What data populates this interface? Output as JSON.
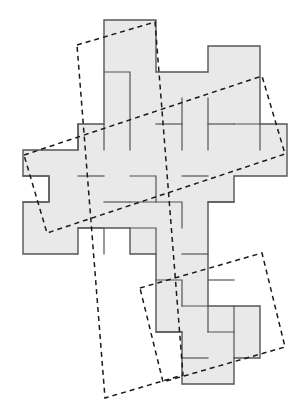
{
  "figure": {
    "kind": "geometric-diagram",
    "caption": "",
    "canvas": {
      "width": 308,
      "height": 403
    },
    "grid": {
      "cell_size": 26.0,
      "origin_x": 23.0,
      "origin_y": 20.0,
      "visible": false
    },
    "colors": {
      "background": "#ffffff",
      "tile_fill": "#e9e9e9",
      "tile_stroke": "#555555",
      "dashed_stroke": "#1a1a1a",
      "caption_text": "#bdbdbd"
    },
    "strokes": {
      "tile_outline_width": 1.2,
      "piece_divider_width": 1.2,
      "dashed_width": 1.5,
      "dash_pattern": "5,4"
    }
  },
  "shapes": {
    "outline_label": "composite-polyomino-outline",
    "outline_points": "104,20 156,20 156,72 208,72 208,46 260,46 260,124 287,124 287,176 234,176 234,202 208,202 208,306 260,306 260,358 234,358 234,384 182,384 182,332 156,332 156,254 130,254 130,228 78,228 78,254 23,254 23,202 49,202 49,176 23,176 23,150 78,150 78,124 104,124 104,20",
    "pieces": [
      {
        "name": "piece-top",
        "points": "104,20 156,20 156,124 182,124 182,98 208,98 208,150 130,150 130,72 104,72 104,20"
      },
      {
        "name": "piece-upper-right",
        "points": "208,72 260,72 260,46 260,124 287,124 287,176 234,176 234,202 208,202 208,150 182,150 182,124 208,124 208,72"
      },
      {
        "name": "piece-left-cross",
        "points": "23,150 78,150 78,124 104,124 104,202 130,202 130,228 78,228 78,254 23,254 23,202 49,202 49,176 23,176 23,150"
      },
      {
        "name": "piece-center",
        "points": "130,150 208,150 208,202 182,202 182,228 156,228 156,254 130,254 130,228 104,228 104,202 130,202 130,150"
      },
      {
        "name": "piece-lower",
        "points": "156,254 208,254 208,306 260,306 260,358 234,358 234,384 182,384 182,332 156,332 156,254"
      }
    ],
    "interior_dividers": [
      "104,72 130,72 130,150",
      "182,98 182,150",
      "208,98 208,150",
      "78,124 78,150",
      "104,124 104,150",
      "156,124 182,124",
      "23,176 49,176 49,202 23,202",
      "78,176 104,176",
      "130,176 156,176 156,202 130,202",
      "182,176 208,176",
      "234,124 260,124 260,150",
      "208,124 234,124",
      "104,202 130,202",
      "156,202 182,202 182,228",
      "208,202 234,202",
      "78,228 104,228 104,254",
      "130,228 156,228 156,254",
      "182,254 208,254",
      "156,280 182,280 182,306",
      "208,280 234,280",
      "182,306 208,306 208,332",
      "234,306 234,332",
      "156,332 182,332",
      "208,332 234,332 234,358",
      "182,358 208,358"
    ],
    "dashed_quads": [
      {
        "name": "dashed-quad-vertical",
        "points": "77,45 155,22 183,375 105,398",
        "closed": true
      },
      {
        "name": "dashed-quad-horizontal",
        "points": "24,155 262,76 285,154 47,233",
        "closed": true
      },
      {
        "name": "dashed-quad-lower-right",
        "points": "140,288 262,253 285,347 163,382",
        "closed": true
      }
    ]
  }
}
